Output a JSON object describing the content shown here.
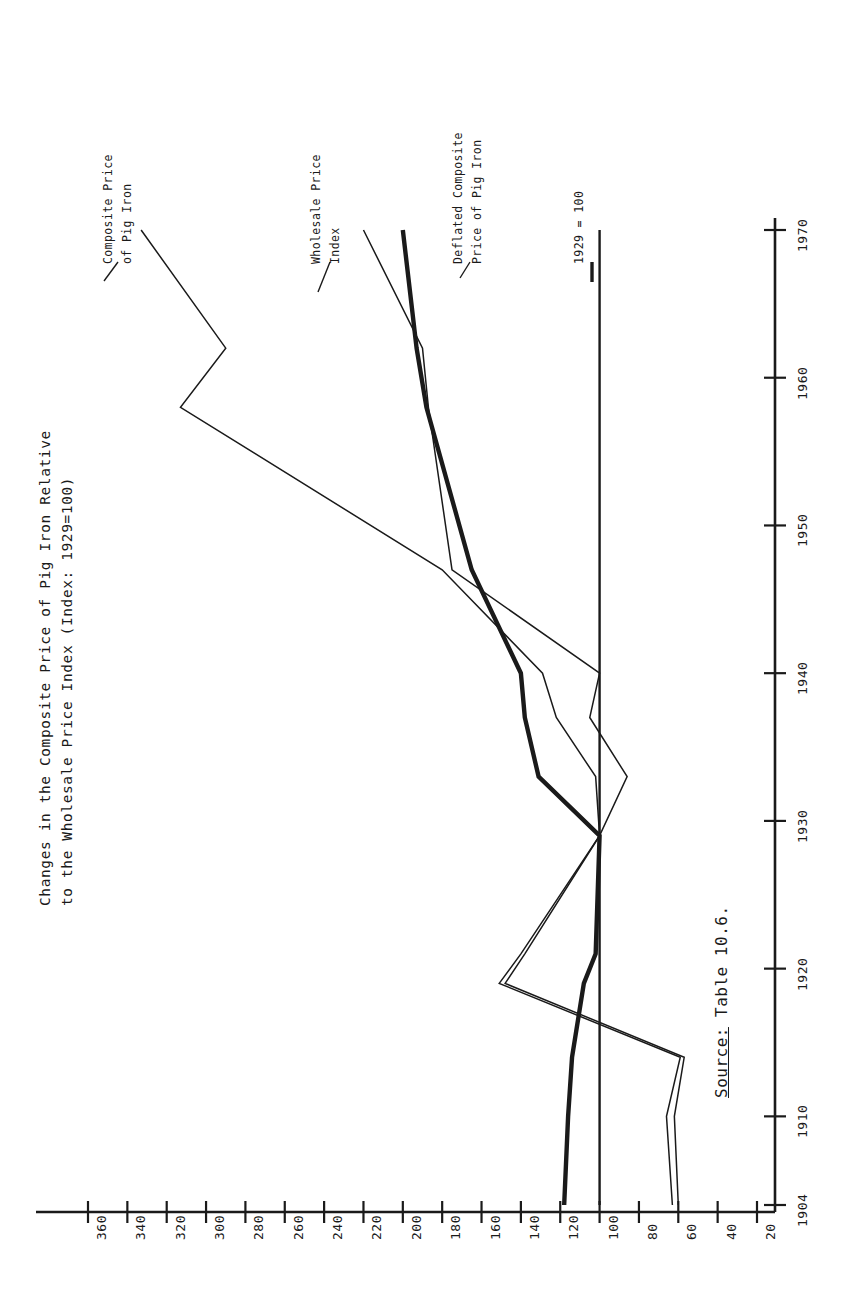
{
  "figure": {
    "title_line1": "Changes in the Composite Price of Pig Iron Relative",
    "title_line2": "to the Wholesale Price Index (Index: 1929=100)",
    "source_prefix": "Source:",
    "source_text": " Table 10.6.",
    "orientation": "rotated-90-ccw",
    "ink_color": "#1a1a1a"
  },
  "annotations": {
    "composite_label_l1": "Composite Price",
    "composite_label_l2": "of Pig Iron",
    "wholesale_label_l1": "Wholesale Price",
    "wholesale_label_l2": "Index",
    "deflated_label_l1": "Deflated Composite",
    "deflated_label_l2": "Price of Pig Iron",
    "baseline_label": "1929 = 100"
  },
  "chart_data": {
    "type": "line",
    "title": "Changes in the Composite Price of Pig Iron Relative to the Wholesale Price Index (Index: 1929=100)",
    "xlabel": "",
    "ylabel": "",
    "grid": false,
    "legend": "inline-labels",
    "xlim": [
      1904,
      1972
    ],
    "ylim": [
      0,
      370
    ],
    "xticks": [
      1904,
      1910,
      1920,
      1930,
      1940,
      1950,
      1960,
      1970
    ],
    "xtick_labels": [
      "1904",
      "1910",
      "1920",
      "1930",
      "1940",
      "1950",
      "1960",
      "1970"
    ],
    "yticks": [
      20,
      40,
      60,
      80,
      100,
      120,
      140,
      160,
      180,
      200,
      220,
      240,
      260,
      280,
      300,
      320,
      340,
      360
    ],
    "ytick_labels": [
      "20",
      "40",
      "60",
      "80",
      "100",
      "120",
      "140",
      "160",
      "180",
      "200",
      "220",
      "240",
      "260",
      "280",
      "300",
      "320",
      "340",
      "360"
    ],
    "x": [
      1904,
      1910,
      1914,
      1919,
      1921,
      1929,
      1933,
      1937,
      1940,
      1947,
      1958,
      1962,
      1970
    ],
    "series": [
      {
        "name": "Composite Price of Pig Iron",
        "style": "thin",
        "values": [
          60,
          62,
          57,
          148,
          138,
          100,
          102,
          122,
          129,
          180,
          313,
          290,
          333
        ]
      },
      {
        "name": "Wholesale Price Index",
        "style": "thin",
        "values": [
          63,
          66,
          59,
          151,
          140,
          100,
          86,
          105,
          100,
          175,
          187,
          190,
          220
        ]
      },
      {
        "name": "Deflated Composite Price of Pig Iron",
        "style": "thick",
        "values": [
          118,
          116,
          114,
          108,
          102,
          100,
          131,
          138,
          140,
          165,
          188,
          193,
          200
        ]
      },
      {
        "name": "1929 = 100 baseline",
        "style": "reference",
        "values": [
          100,
          100,
          100,
          100,
          100,
          100,
          100,
          100,
          100,
          100,
          100,
          100,
          100
        ]
      }
    ]
  }
}
